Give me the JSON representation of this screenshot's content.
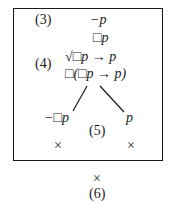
{
  "diagram": {
    "type": "modal tableau tree",
    "frame": "boxed world",
    "labels": {
      "step3": "(3)",
      "step4": "(4)",
      "step5": "(5)",
      "step6": "(6)"
    },
    "nodes": {
      "line1": "−p",
      "line2": "□p",
      "line3": "√□p → p",
      "line4": "□(□p → p)",
      "left_branch": "−□p",
      "right_branch": "p"
    },
    "closures": {
      "left": "×",
      "right": "×",
      "outer": "×"
    }
  }
}
